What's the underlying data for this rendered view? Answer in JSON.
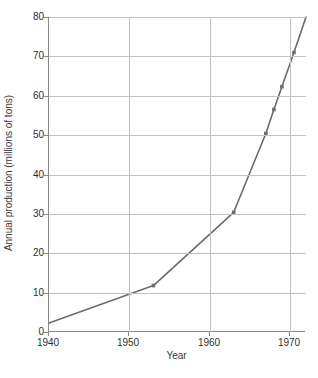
{
  "chart_data": {
    "type": "line",
    "title": "",
    "xlabel": "Year",
    "ylabel": "Annual production (millions of tons)",
    "xlim": [
      1940,
      1972
    ],
    "ylim": [
      0,
      80
    ],
    "xticks": [
      1940,
      1950,
      1960,
      1970
    ],
    "yticks": [
      0,
      10,
      20,
      30,
      40,
      50,
      60,
      70,
      80
    ],
    "grid": "horizontal-and-vertical",
    "legend": "none",
    "series": [
      {
        "name": "Annual production",
        "marker": "square",
        "color": "#6b6b6b",
        "x": [
          1940,
          1953,
          1963,
          1967,
          1968,
          1969,
          1970.5,
          1972
        ],
        "y": [
          2.3,
          11.8,
          30.4,
          50.4,
          56.5,
          62.3,
          71.0,
          80.0
        ]
      }
    ],
    "points": [
      {
        "year": 1940,
        "value": 2.3,
        "marker": false
      },
      {
        "year": 1953,
        "value": 11.8,
        "marker": true
      },
      {
        "year": 1963,
        "value": 30.4,
        "marker": true
      },
      {
        "year": 1967,
        "value": 50.4,
        "marker": true
      },
      {
        "year": 1968,
        "value": 56.5,
        "marker": true
      },
      {
        "year": 1969,
        "value": 62.3,
        "marker": true
      },
      {
        "year": 1970.5,
        "value": 71.0,
        "marker": true
      },
      {
        "year": 1972,
        "value": 80.0,
        "marker": false
      }
    ]
  },
  "axis": {
    "y_title": "Annual production (millions of tons)",
    "x_title": "Year",
    "y_tick_labels": [
      "0",
      "10",
      "20",
      "30",
      "40",
      "50",
      "60",
      "70",
      "80"
    ],
    "x_tick_labels": [
      "1940",
      "1950",
      "1960",
      "1970"
    ]
  },
  "colors": {
    "line": "#6b6b6b",
    "marker": "#6e6e6e",
    "grid": "#c2c2c2",
    "axis": "#8a8a8a",
    "text": "#2e2e2e",
    "background": "#ffffff"
  }
}
